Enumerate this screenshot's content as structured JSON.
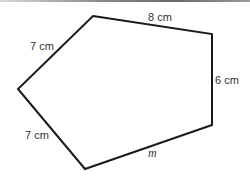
{
  "diagram": {
    "shape": "pentagon",
    "stroke_color": "#1a1a1a",
    "vertices": [
      {
        "x": 93,
        "y": 16
      },
      {
        "x": 212,
        "y": 34
      },
      {
        "x": 212,
        "y": 125
      },
      {
        "x": 85,
        "y": 169
      },
      {
        "x": 18,
        "y": 89
      }
    ],
    "sides": [
      {
        "label": "8 cm",
        "italic": false
      },
      {
        "label": "6 cm",
        "italic": false
      },
      {
        "label": "m",
        "italic": true
      },
      {
        "label": "7 cm",
        "italic": false
      },
      {
        "label": "7 cm",
        "italic": false
      }
    ]
  }
}
